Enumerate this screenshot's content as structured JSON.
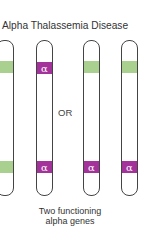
{
  "title": "Alpha Thalassemia Disease",
  "separator": "OR",
  "caption_line1": "Two functioning",
  "caption_line2": "alpha genes",
  "colors": {
    "functional_band": "#a9d08e",
    "alpha_band": "#a3339a",
    "outline": "#444444"
  },
  "chromosomes": [
    {
      "top_band": "green",
      "bottom_band": "green"
    },
    {
      "top_band": "alpha",
      "bottom_band": "alpha",
      "label": "α"
    },
    {
      "top_band": "green",
      "bottom_band": "alpha",
      "label": "α"
    },
    {
      "top_band": "green",
      "bottom_band": "alpha",
      "label": "α"
    }
  ],
  "alpha_symbol": "α"
}
